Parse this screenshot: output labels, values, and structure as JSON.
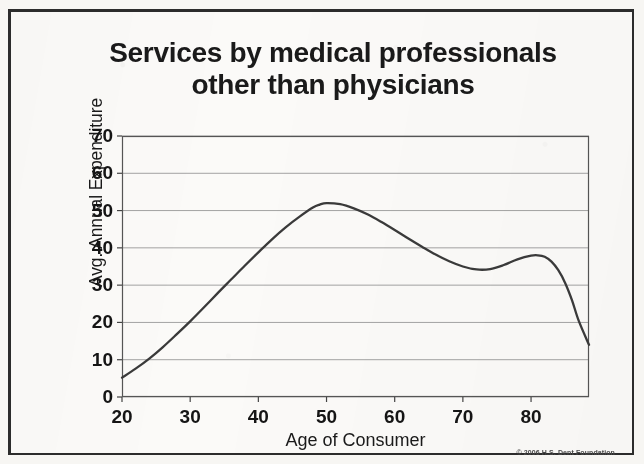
{
  "title": {
    "line1": "Services by medical professionals",
    "line2": "other than physicians"
  },
  "copyright": "© 2006 H.S. Dent Foundation",
  "colors": {
    "page_background": "#f7f6f3",
    "plot_background": "#fbfaf8",
    "border": "#2c2c2c",
    "line": "#3a3a3a",
    "gridline": "#8d8d8d",
    "text": "#1a1a1a"
  },
  "chart_data": {
    "type": "line",
    "title": "Services by medical professionals other than physicians",
    "xlabel": "Age of Consumer",
    "ylabel": "Avg. Annual Expenditure",
    "xlim": [
      20,
      88.5
    ],
    "ylim": [
      0,
      70
    ],
    "xticks": [
      20,
      30,
      40,
      50,
      60,
      70,
      80
    ],
    "yticks": [
      0,
      10,
      20,
      30,
      40,
      50,
      60,
      70
    ],
    "xtick_labels": [
      "20",
      "30",
      "40",
      "50",
      "60",
      "70",
      "80"
    ],
    "ytick_labels": [
      "0",
      "10",
      "20",
      "30",
      "40",
      "50",
      "60",
      "70"
    ],
    "grid": true,
    "grid_axis": "y",
    "legend": false,
    "series": [
      {
        "name": "Avg. Annual Expenditure",
        "x": [
          20,
          22,
          24,
          26,
          28,
          30,
          32,
          34,
          36,
          38,
          40,
          42,
          44,
          46,
          48,
          49,
          50,
          52,
          54,
          56,
          58,
          60,
          62,
          64,
          66,
          68,
          70,
          72,
          74,
          76,
          78,
          80,
          81,
          82,
          83,
          84,
          85,
          86,
          87,
          88.5
        ],
        "y": [
          5.2,
          7.6,
          10.3,
          13.4,
          16.8,
          20.3,
          24.0,
          27.8,
          31.5,
          35.2,
          38.8,
          42.3,
          45.5,
          48.3,
          50.8,
          51.6,
          52.0,
          51.7,
          50.6,
          49.0,
          47.0,
          44.8,
          42.5,
          40.3,
          38.2,
          36.4,
          35.0,
          34.2,
          34.3,
          35.4,
          36.9,
          37.9,
          38.0,
          37.6,
          36.3,
          34.0,
          30.6,
          26.0,
          20.4,
          14.0
        ]
      }
    ],
    "annotations": {
      "peak": {
        "x": 49,
        "y": 52.0
      },
      "local_minimum": {
        "x": 72,
        "y": 34.2
      },
      "secondary_peak": {
        "x": 80.5,
        "y": 38.0
      },
      "endpoint": {
        "x": 88.5,
        "y": 14.0
      }
    }
  }
}
